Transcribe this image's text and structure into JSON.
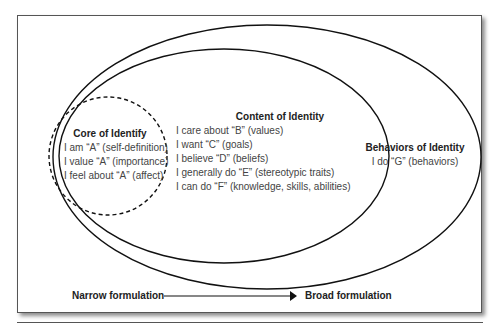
{
  "diagram": {
    "type": "nested-ellipses",
    "core": {
      "title": "Core of Identify",
      "items": [
        "I am “A” (self-definition)",
        "I value “A” (importance)",
        "I feel about “A” (affect)"
      ],
      "border_style": "dashed"
    },
    "content": {
      "title": "Content of Identity",
      "items": [
        "I care about “B” (values)",
        "I want “C” (goals)",
        "I believe “D” (beliefs)",
        "I generally do “E” (stereotypic traits)",
        "I can do “F” (knowledge, skills, abilities)"
      ]
    },
    "behaviors": {
      "title": "Behaviors of Identity",
      "items": [
        "I do “G” (behaviors)"
      ]
    },
    "axis": {
      "left_label": "Narrow formulation",
      "right_label": "Broad formulation"
    }
  }
}
